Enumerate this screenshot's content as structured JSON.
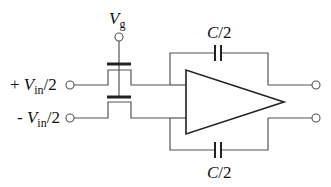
{
  "diagram": {
    "type": "circuit-schematic",
    "labels": {
      "gate_voltage": {
        "main": "V",
        "sub": "g"
      },
      "input_plus": {
        "prefix": "+ ",
        "main": "V",
        "sub": "in",
        "suffix": "/2"
      },
      "input_minus": {
        "prefix": "- ",
        "main": "V",
        "sub": "in",
        "suffix": "/2"
      },
      "cap_top": {
        "main": "C",
        "suffix": "/2"
      },
      "cap_bottom": {
        "main": "C",
        "suffix": "/2"
      }
    },
    "components": [
      "gate-terminal",
      "nmos-switch-top",
      "nmos-switch-bottom",
      "differential-amplifier",
      "feedback-capacitor-top",
      "feedback-capacitor-bottom",
      "input-terminal-plus",
      "input-terminal-minus",
      "output-terminal-top",
      "output-terminal-bottom"
    ],
    "colors": {
      "wire": "#555555",
      "component": "#222222",
      "text": "#111111"
    }
  }
}
